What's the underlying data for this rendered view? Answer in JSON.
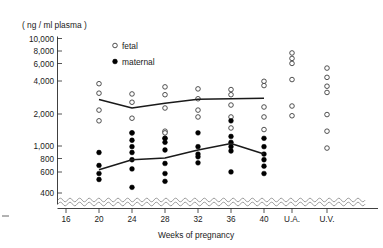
{
  "chart_data": {
    "type": "scatter",
    "title": "",
    "subtitle": "",
    "xlabel": "Weeks of pregnancy",
    "ylabel": "( ng / ml plasma )",
    "yscale": "log",
    "ylim": [
      330,
      10000
    ],
    "grid": false,
    "legend_position": "top-center",
    "axis_break": "wavy break between 400 and axis baseline",
    "ytick_labels": [
      "10,000",
      "8,000",
      "6,000",
      "4,000",
      "2,000",
      "1,000",
      "800",
      "600",
      "400"
    ],
    "ytick_values": [
      10000,
      8000,
      6000,
      4000,
      2000,
      1000,
      800,
      600,
      400
    ],
    "categories": [
      "16",
      "20",
      "24",
      "28",
      "32",
      "36",
      "40",
      "U.A.",
      "U.V."
    ],
    "legend": [
      {
        "name": "fetal",
        "marker": "open-circle",
        "color": "#ffffff"
      },
      {
        "name": "maternal",
        "marker": "filled-circle",
        "color": "#000000"
      }
    ],
    "series": [
      {
        "name": "fetal",
        "marker": "open-circle",
        "points": {
          "16": [],
          "20": [
            3900,
            3200,
            2250,
            1800
          ],
          "24": [
            3150,
            2650,
            1900,
            1400
          ],
          "28": [
            3650,
            3100,
            2350,
            1450,
            1400,
            1250
          ],
          "32": [
            3500,
            2850,
            2250,
            1950
          ],
          "36": [
            3450,
            3100,
            2500,
            1950,
            1550
          ],
          "40": [
            4100,
            3750,
            2400,
            1950,
            1500
          ],
          "U.A.": [
            7400,
            6600,
            5950,
            4250,
            2450,
            2000
          ],
          "U.V.": [
            5400,
            4450,
            3700,
            3250,
            2050,
            1450,
            1020
          ]
        }
      },
      {
        "name": "maternal",
        "marker": "filled-circle",
        "points": {
          "16": [],
          "20": [
            930,
            710,
            600,
            530
          ],
          "24": [
            1400,
            1200,
            1050,
            930,
            800,
            660,
            450
          ],
          "28": [
            1250,
            1150,
            980,
            740,
            600,
            510
          ],
          "32": [
            1400,
            1050,
            900,
            850,
            750
          ],
          "36": [
            1800,
            1300,
            1150,
            1050,
            960,
            620
          ],
          "40": [
            1250,
            1050,
            900,
            800,
            700,
            600
          ]
        }
      }
    ],
    "trend_lines": [
      {
        "name": "fetal-mean",
        "x": [
          "20",
          "24",
          "28",
          "32",
          "36",
          "40"
        ],
        "y": [
          2800,
          2350,
          2600,
          2820,
          2850,
          2880
        ]
      },
      {
        "name": "maternal-mean",
        "x": [
          "20",
          "24",
          "28",
          "32",
          "36",
          "40"
        ],
        "y": [
          650,
          800,
          830,
          980,
          1120,
          900
        ]
      }
    ]
  }
}
